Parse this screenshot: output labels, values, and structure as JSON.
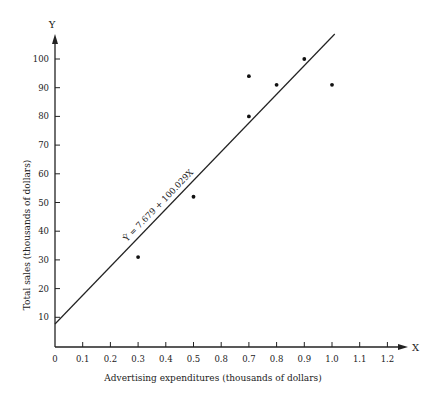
{
  "chart_data": {
    "type": "scatter",
    "title": "",
    "xlabel": "Advertising expenditures (thousands of dollars)",
    "ylabel": "Total sales (thousands of dollars)",
    "x_axis_letter": "X",
    "y_axis_letter": "Y",
    "xlim": [
      0,
      1.25
    ],
    "ylim": [
      0,
      108
    ],
    "x_ticks": [
      "0",
      "0.1",
      "0.2",
      "0.3",
      "0.4",
      "0.5",
      "0.8",
      "0.7",
      "0.8",
      "0.9",
      "1.0",
      "1.1",
      "1.2"
    ],
    "x_tick_values": [
      0,
      0.1,
      0.2,
      0.3,
      0.4,
      0.5,
      0.6,
      0.7,
      0.8,
      0.9,
      1.0,
      1.1,
      1.2
    ],
    "y_ticks": [
      "10",
      "20",
      "30",
      "40",
      "50",
      "60",
      "70",
      "80",
      "90",
      "100"
    ],
    "y_tick_values": [
      10,
      20,
      30,
      40,
      50,
      60,
      70,
      80,
      90,
      100
    ],
    "grid": false,
    "points": [
      {
        "x": 0.3,
        "y": 31
      },
      {
        "x": 0.5,
        "y": 52
      },
      {
        "x": 0.7,
        "y": 94
      },
      {
        "x": 0.7,
        "y": 80
      },
      {
        "x": 0.8,
        "y": 91
      },
      {
        "x": 0.9,
        "y": 100
      },
      {
        "x": 1.0,
        "y": 91
      }
    ],
    "regression_line": {
      "intercept": 7.679,
      "slope": 100.029,
      "x_range": [
        0,
        1.01
      ],
      "label": "Ŷ = 7.679 + 100.029X"
    }
  }
}
